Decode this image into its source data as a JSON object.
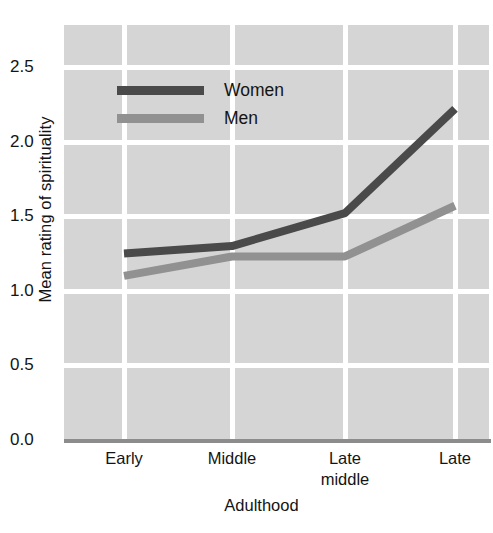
{
  "chart_data": {
    "type": "line",
    "title": "",
    "xlabel": "Adulthood",
    "ylabel": "Mean rating of spirituality",
    "categories": [
      "Early",
      "Middle",
      "Late middle",
      "Late"
    ],
    "category_lines": [
      [
        "Early"
      ],
      [
        "Middle"
      ],
      [
        "Late",
        "middle"
      ],
      [
        "Late"
      ]
    ],
    "series": [
      {
        "name": "Women",
        "values": [
          1.25,
          1.3,
          1.52,
          2.22
        ],
        "color": "#4a4a4a"
      },
      {
        "name": "Men",
        "values": [
          1.1,
          1.23,
          1.23,
          1.57
        ],
        "color": "#919191"
      }
    ],
    "yticks": [
      "2.5",
      "2.0",
      "1.5",
      "1.0",
      "0.5",
      "0.0"
    ],
    "ytick_values": [
      2.5,
      2.0,
      1.5,
      1.0,
      0.5,
      0.0
    ],
    "ylim": [
      0.0,
      2.5
    ],
    "grid": true,
    "legend_position": "top-left",
    "plot_background": "#d5d5d5",
    "grid_color": "#ffffff",
    "axis_color": "#8c8c8c"
  },
  "legend": {
    "items": [
      {
        "label": "Women",
        "color": "#4a4a4a"
      },
      {
        "label": "Men",
        "color": "#919191"
      }
    ]
  }
}
